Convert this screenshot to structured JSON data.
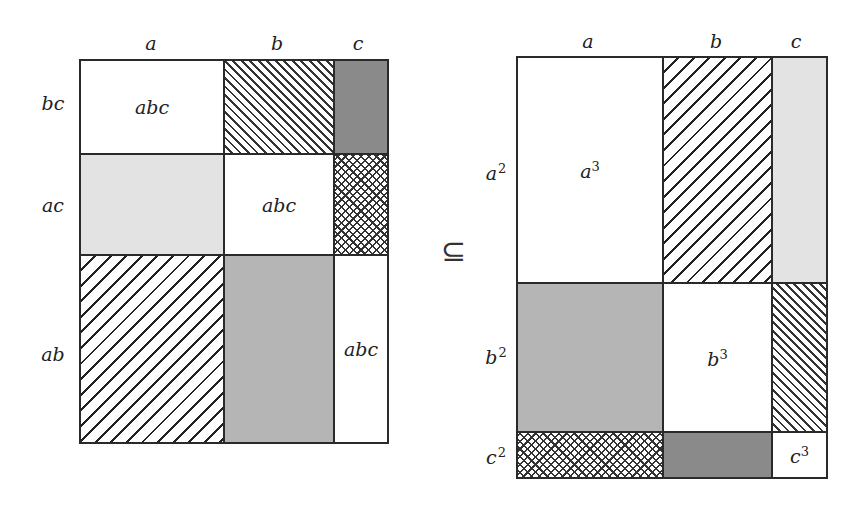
{
  "left_matrix": {
    "column_labels": [
      "a",
      "b",
      "c"
    ],
    "row_labels": [
      "bc",
      "ac",
      "ab"
    ],
    "cells": [
      [
        "abc",
        "",
        ""
      ],
      [
        "",
        "abc",
        ""
      ],
      [
        "",
        "",
        "abc"
      ]
    ],
    "fills": [
      [
        "white",
        "dense-back-hatch",
        "dark-gray"
      ],
      [
        "light-gray",
        "white",
        "crosshatch"
      ],
      [
        "wide-forward-hatch",
        "mid-gray",
        "white"
      ]
    ]
  },
  "relation_symbol": "⊆",
  "right_matrix": {
    "column_labels": [
      "a",
      "b",
      "c"
    ],
    "row_labels": [
      {
        "base": "a",
        "exp": "2"
      },
      {
        "base": "b",
        "exp": "2"
      },
      {
        "base": "c",
        "exp": "2"
      }
    ],
    "cells": [
      [
        {
          "base": "a",
          "exp": "3"
        },
        null,
        null
      ],
      [
        null,
        {
          "base": "b",
          "exp": "3"
        },
        null
      ],
      [
        null,
        null,
        {
          "base": "c",
          "exp": "3"
        }
      ]
    ],
    "fills": [
      [
        "white",
        "wide-forward-hatch",
        "light-gray"
      ],
      [
        "mid-gray",
        "white",
        "dense-back-hatch"
      ],
      [
        "crosshatch",
        "dark-gray",
        "white"
      ]
    ]
  },
  "colors": {
    "border": "#2a2a2a",
    "dark_gray": "#8a8a8a",
    "mid_gray": "#b5b5b5",
    "light_gray": "#e3e3e3",
    "white": "#ffffff"
  }
}
